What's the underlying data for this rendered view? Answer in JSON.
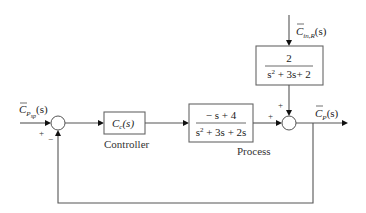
{
  "diagram": {
    "type": "block-diagram",
    "signals": {
      "setpoint": {
        "symbol": "C",
        "sub": "P",
        "subsub": "sp",
        "arg": "(s)"
      },
      "disturbance": {
        "symbol": "C",
        "sub": "in,R",
        "arg": "(s)"
      },
      "output": {
        "symbol": "C",
        "sub": "P",
        "arg": "(s)"
      }
    },
    "blocks": {
      "controller": {
        "text_main": "C",
        "text_sub": "c",
        "text_arg": "(s)",
        "caption": "Controller"
      },
      "process": {
        "numerator": "− s + 4",
        "denominator_a": "s",
        "denominator_exp": "2",
        "denominator_b": " + 3s + 2s",
        "caption": "Process"
      },
      "disturbance": {
        "numerator": "2",
        "denominator_a": "s",
        "denominator_exp": "2",
        "denominator_b": " + 3s+ 2"
      }
    },
    "junctions": {
      "comparator": {
        "input_sign": "+",
        "feedback_sign": "−"
      },
      "output_sum": {
        "process_sign": "+",
        "disturbance_sign": "+"
      }
    }
  }
}
